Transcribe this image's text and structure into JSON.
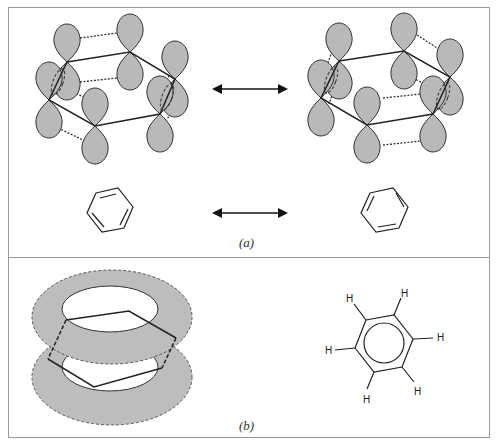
{
  "figure": {
    "panels": [
      {
        "id": "a",
        "label": "(a)",
        "description": "Two Kekulé resonance structures of benzene shown as overlapping p-orbital diagrams and line structures, connected by double-headed resonance arrows",
        "orbital_structures": [
          "kekule-left",
          "kekule-right"
        ],
        "line_structures": [
          "kekule-left",
          "kekule-right"
        ],
        "arrows": 2
      },
      {
        "id": "b",
        "label": "(b)",
        "description": "Delocalized pi-electron cloud above and below the benzene ring, and benzene drawn with an inscribed circle",
        "hydrogen_label": "H",
        "hydrogens": [
          "H",
          "H",
          "H",
          "H",
          "H",
          "H"
        ]
      }
    ],
    "colors": {
      "lobe_fill": "#b9b9b9",
      "stroke": "#2a2a2a",
      "frame": "#9a9a9a"
    }
  }
}
